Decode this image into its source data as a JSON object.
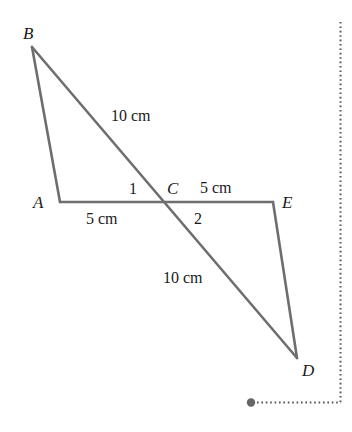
{
  "diagram": {
    "type": "geometry",
    "colors": {
      "line": "#6e6e6e",
      "dotted": "#555555",
      "dot": "#666666",
      "text": "#1a1a1a",
      "background": "#ffffff"
    },
    "vertices": {
      "A": {
        "label": "A",
        "x": 60,
        "y": 202
      },
      "B": {
        "label": "B",
        "x": 32,
        "y": 47
      },
      "C": {
        "label": "C",
        "x": 163,
        "y": 202
      },
      "D": {
        "label": "D",
        "x": 297,
        "y": 358
      },
      "E": {
        "label": "E",
        "x": 273,
        "y": 202
      }
    },
    "segments": [
      {
        "from": "B",
        "to": "A"
      },
      {
        "from": "A",
        "to": "E"
      },
      {
        "from": "E",
        "to": "D"
      },
      {
        "from": "B",
        "to": "D"
      }
    ],
    "measurements": {
      "BC": "10 cm",
      "AC": "5 cm",
      "CE": "5 cm",
      "CD": "10 cm"
    },
    "angles": {
      "angle1": "1",
      "angle2": "2"
    },
    "guide": {
      "vertical_dotted": {
        "x": 340,
        "y1": 22,
        "y2": 402
      },
      "horizontal_dotted": {
        "x1": 256,
        "x2": 340,
        "y": 402
      },
      "handle_dot": {
        "x": 251,
        "y": 402,
        "r": 4
      }
    }
  }
}
